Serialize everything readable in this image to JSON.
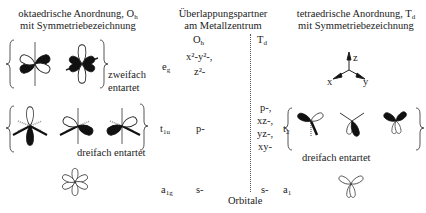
{
  "left_heading": {
    "line1": "oktaedrische Anordnung, O",
    "line1_sub": "h",
    "line2": "mit Symmetriebezeichnung"
  },
  "center_heading": {
    "line1": "Überlappungspartner",
    "line2": "am Metallzentrum",
    "col_oh": "O",
    "col_oh_sub": "h",
    "col_td": "T",
    "col_td_sub": "d"
  },
  "right_heading": {
    "line1": "tetraedrische Anordnung, T",
    "line1_sub": "d",
    "line2": "mit Symmetriebezeichnung"
  },
  "axes": {
    "z": "z",
    "x": "x",
    "y": "y"
  },
  "rows": [
    {
      "oh_symbol": "e",
      "oh_symbol_sub": "g",
      "oh_orbitals": [
        "x²-y²-,",
        "z²-"
      ],
      "td_orbitals": [],
      "degeneracy_label_1": "zweifach",
      "degeneracy_label_2": "entartet"
    },
    {
      "oh_symbol": "t",
      "oh_symbol_sub": "1u",
      "oh_orbitals": [
        "p-"
      ],
      "td_symbol": "t",
      "td_symbol_sub": "2",
      "td_orbitals": [
        "p-,",
        "xz-,",
        "yz-,",
        "xy-"
      ],
      "oh_degeneracy_label": "dreifach entartet",
      "td_degeneracy_label": "dreifach entartet"
    },
    {
      "oh_symbol": "a",
      "oh_symbol_sub": "1g",
      "oh_orbitals": [
        "s-"
      ],
      "td_symbol": "a",
      "td_symbol_sub": "1",
      "td_orbitals": [
        "s-"
      ]
    }
  ],
  "footer_label": "Orbitale"
}
